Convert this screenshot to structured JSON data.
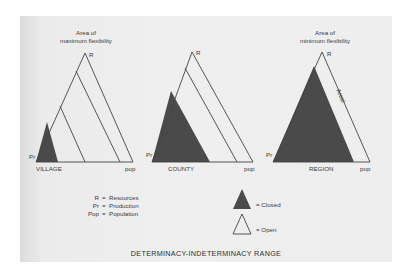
{
  "title": "DETERMINACY-INDETERMINACY RANGE",
  "colors": {
    "closed_fill": "#4a4a4a",
    "line": "#444444",
    "paper": "#ececec",
    "background": "#ffffff"
  },
  "triangles": [
    {
      "id": "village",
      "label": "VILLAGE",
      "top_annotation_line1": "Area of",
      "top_annotation_line2": "maximum flexibility",
      "vertex_top": "R",
      "vertex_left": "Pr",
      "vertex_right": "pop",
      "inner_lines": 3,
      "closed_portion": "small"
    },
    {
      "id": "county",
      "label": "COUNTY",
      "vertex_top": "R",
      "vertex_left": "Pr",
      "vertex_right": "pop",
      "inner_lines": 2,
      "closed_portion": "medium"
    },
    {
      "id": "region",
      "label": "REGION",
      "top_annotation_line1": "Area of",
      "top_annotation_line2": "minimum flexibility",
      "vertex_top": "R",
      "vertex_left": "Pr",
      "vertex_right": "pop",
      "edge_label": "Areal",
      "inner_lines": 0,
      "closed_portion": "large"
    }
  ],
  "key": [
    {
      "abbr": "R",
      "eq": "=",
      "meaning": "Resources"
    },
    {
      "abbr": "Pr",
      "eq": "=",
      "meaning": "Production"
    },
    {
      "abbr": "Pop",
      "eq": "=",
      "meaning": "Population"
    }
  ],
  "legend": {
    "closed": "= Closed",
    "open": "= Open"
  }
}
